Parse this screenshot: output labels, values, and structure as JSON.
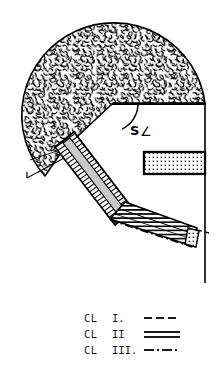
{
  "figure": {
    "angle_label": {
      "symbol": "S",
      "angle_glyph": "∠"
    },
    "regions": [
      {
        "name": "soil-mass",
        "pattern": "random-squiggle",
        "fill": "#ffffff",
        "stroke": "#000000"
      },
      {
        "name": "upper-band",
        "pattern": "diagonal-hatch",
        "fill": "#ffffff",
        "stroke": "#000000"
      },
      {
        "name": "lower-band",
        "pattern": "horizontal-hatch",
        "fill": "#ffffff",
        "stroke": "#000000"
      },
      {
        "name": "core-stripe",
        "pattern": "solid-light",
        "fill": "#c9c9c9",
        "stroke": "#000000"
      },
      {
        "name": "right-layer",
        "pattern": "stipple-dots",
        "fill": "#ffffff",
        "stroke": "#000000"
      },
      {
        "name": "end-block",
        "pattern": "stipple-dots",
        "fill": "#ffffff",
        "stroke": "#000000"
      }
    ],
    "colors": {
      "ink": "#000000",
      "paper": "#ffffff",
      "gray_fill": "#c9c9c9",
      "legend_ink": "#1a1a1a"
    }
  },
  "legend": {
    "rows": [
      {
        "prefix": "CL",
        "roman": "I.",
        "style": "dashed",
        "sample_name": "dashed-line-sample"
      },
      {
        "prefix": "CL",
        "roman": "II",
        "style": "double",
        "sample_name": "double-line-sample"
      },
      {
        "prefix": "CL",
        "roman": "III.",
        "style": "dashdot",
        "sample_name": "dash-dot-line-sample"
      }
    ]
  }
}
